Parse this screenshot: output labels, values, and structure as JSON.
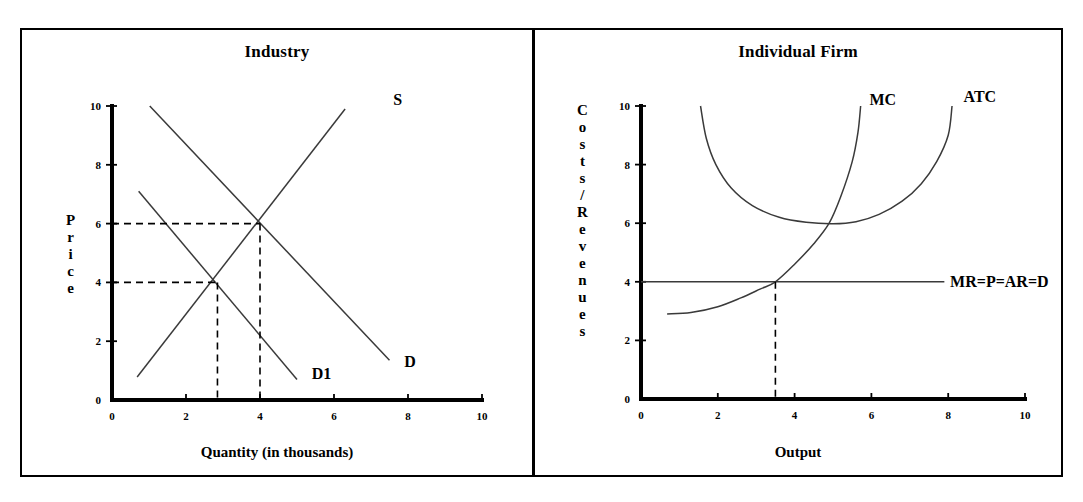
{
  "figure": {
    "panels": [
      {
        "id": "industry",
        "title": "Industry",
        "xlabel": "Quantity (in thousands)",
        "ylabel_letters": [
          "P",
          "r",
          "i",
          "c",
          "e"
        ],
        "ylabel_text": "Price",
        "xticks": [
          "0",
          "2",
          "4",
          "6",
          "8",
          "10"
        ],
        "yticks": [
          "0",
          "2",
          "4",
          "6",
          "8",
          "10"
        ],
        "curve_labels": {
          "supply": "S",
          "demand": "D",
          "demand_shift": "D1"
        }
      },
      {
        "id": "firm",
        "title": "Individual Firm",
        "xlabel": "Output",
        "ylabel_letters": [
          "C",
          "o",
          "s",
          "t",
          "s",
          "/",
          "R",
          "e",
          "v",
          "e",
          "n",
          "u",
          "e",
          "s"
        ],
        "ylabel_text": "Costs / Revenues",
        "xticks": [
          "0",
          "2",
          "4",
          "6",
          "8",
          "10"
        ],
        "yticks": [
          "0",
          "2",
          "4",
          "6",
          "8",
          "10"
        ],
        "curve_labels": {
          "marginal_cost": "MC",
          "average_total_cost": "ATC",
          "revenue": "MR=P=AR=D"
        }
      }
    ]
  },
  "chart_data": [
    {
      "type": "line",
      "id": "industry",
      "title": "Industry",
      "xlabel": "Quantity (in thousands)",
      "ylabel": "Price",
      "xlim": [
        0,
        10
      ],
      "ylim": [
        0,
        10
      ],
      "xticks": [
        0,
        2,
        4,
        6,
        8,
        10
      ],
      "yticks": [
        0,
        2,
        4,
        6,
        8,
        10
      ],
      "grid": false,
      "legend": "inline-labels",
      "series": [
        {
          "name": "S",
          "label": "S",
          "label_xy": [
            7.6,
            10.2
          ],
          "points": [
            [
              0.68,
              0.78
            ],
            [
              6.3,
              9.9
            ]
          ]
        },
        {
          "name": "D",
          "label": "D",
          "label_xy": [
            7.9,
            1.3
          ],
          "points": [
            [
              1.02,
              10.0
            ],
            [
              7.5,
              1.35
            ]
          ]
        },
        {
          "name": "D1",
          "label": "D1",
          "label_xy": [
            5.4,
            0.9
          ],
          "points": [
            [
              0.72,
              7.1
            ],
            [
              5.0,
              0.7
            ]
          ]
        }
      ],
      "equilibria": [
        {
          "name": "original",
          "x": 4.0,
          "y": 6.0,
          "dashed": true
        },
        {
          "name": "after-demand-shift",
          "x": 2.85,
          "y": 4.0,
          "dashed": true
        }
      ]
    },
    {
      "type": "line",
      "id": "firm",
      "title": "Individual Firm",
      "xlabel": "Output",
      "ylabel": "Costs / Revenues",
      "xlim": [
        0,
        10
      ],
      "ylim": [
        0,
        10
      ],
      "xticks": [
        0,
        2,
        4,
        6,
        8,
        10
      ],
      "yticks": [
        0,
        2,
        4,
        6,
        8,
        10
      ],
      "grid": false,
      "legend": "inline-labels",
      "series": [
        {
          "name": "MC",
          "label": "MC",
          "label_xy": [
            5.95,
            10.2
          ],
          "points": [
            [
              0.68,
              2.9
            ],
            [
              1.3,
              2.95
            ],
            [
              2.0,
              3.15
            ],
            [
              2.6,
              3.45
            ],
            [
              3.1,
              3.75
            ],
            [
              3.5,
              4.0
            ],
            [
              4.0,
              4.6
            ],
            [
              4.5,
              5.3
            ],
            [
              4.9,
              6.0
            ],
            [
              5.2,
              6.9
            ],
            [
              5.5,
              8.1
            ],
            [
              5.65,
              9.1
            ],
            [
              5.72,
              10.0
            ]
          ]
        },
        {
          "name": "ATC",
          "label": "ATC",
          "label_xy": [
            8.4,
            10.3
          ],
          "points": [
            [
              1.55,
              10.0
            ],
            [
              1.7,
              8.9
            ],
            [
              1.95,
              8.0
            ],
            [
              2.35,
              7.2
            ],
            [
              2.9,
              6.6
            ],
            [
              3.6,
              6.2
            ],
            [
              4.3,
              6.03
            ],
            [
              5.0,
              5.98
            ],
            [
              5.6,
              6.05
            ],
            [
              6.2,
              6.3
            ],
            [
              6.8,
              6.75
            ],
            [
              7.3,
              7.35
            ],
            [
              7.7,
              8.1
            ],
            [
              8.0,
              9.0
            ],
            [
              8.1,
              10.0
            ]
          ]
        },
        {
          "name": "MR=P=AR=D",
          "label": "MR=P=AR=D",
          "label_xy": [
            8.05,
            4.0
          ],
          "points": [
            [
              0.0,
              4.0
            ],
            [
              7.9,
              4.0
            ]
          ]
        }
      ],
      "equilibria": [
        {
          "name": "profit-max",
          "x": 3.5,
          "y": 4.0,
          "dashed": true
        }
      ],
      "annotations": [
        {
          "text": "MC crosses ATC at ATC minimum",
          "x": 4.9,
          "y": 6.0
        }
      ]
    }
  ]
}
